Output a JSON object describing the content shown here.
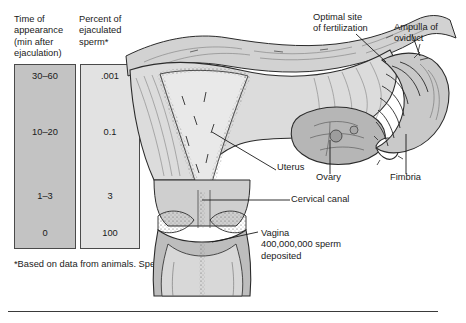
{
  "figure": {
    "type": "anatomical-diagram"
  },
  "table": {
    "headers": {
      "col1": "Time of\nappearance\n(min after\nejaculation)",
      "col2": "Percent of\nejaculated\nsperm*"
    },
    "rows": [
      {
        "time": "30–60",
        "percent": ".001"
      },
      {
        "time": "10–20",
        "percent": "0.1"
      },
      {
        "time": "1–3",
        "percent": "3"
      },
      {
        "time": "0",
        "percent": "100"
      }
    ]
  },
  "footnote": "*Based on data from animals.\nSperm and ovum enlarged.",
  "labels": {
    "optimal_site": "Optimal site\nof fertilization",
    "ampulla": "Ampulla of\noviduct",
    "uterus": "Uterus",
    "ovary": "Ovary",
    "fimbria": "Fimbria",
    "cervical_canal": "Cervical canal",
    "vagina": "Vagina\n400,000,000 sperm\ndeposited"
  },
  "colors": {
    "tissue_light": "#e8e8e8",
    "tissue_mid": "#c9c9c9",
    "tissue_dark": "#a9a9a9",
    "outline": "#2b2b2b",
    "table_col1": "#c3c3c3",
    "table_col2": "#e2e2e2",
    "rule": "#3a3a3a"
  }
}
